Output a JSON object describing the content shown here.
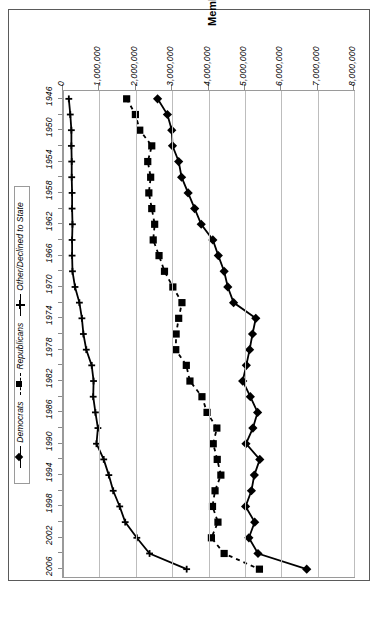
{
  "chart": {
    "title": "Membership",
    "value_axis_label": "Membership",
    "category_axis_label": ""
  },
  "legend": {
    "items": [
      {
        "label": "Democrats",
        "marker": "diamond",
        "line": "solid",
        "color": "#000000"
      },
      {
        "label": "Republicans",
        "marker": "square",
        "line": "dashed",
        "color": "#000000"
      },
      {
        "label": "Other/Declined to State",
        "marker": "cross",
        "line": "solid",
        "color": "#000000"
      }
    ]
  },
  "chart_data": {
    "type": "line",
    "orientation": "horizontal-bars-rotated",
    "title": "Membership",
    "xlabel": "Membership",
    "ylabel": "",
    "xlim": [
      0,
      8000000
    ],
    "grid": true,
    "legend_position": "left",
    "xtick_labels": [
      "0",
      "1,000,000",
      "2,000,000",
      "3,000,000",
      "4,000,000",
      "5,000,000",
      "6,000,000",
      "7,000,000",
      "8,000,000"
    ],
    "xticks": [
      0,
      1000000,
      2000000,
      3000000,
      4000000,
      5000000,
      6000000,
      7000000,
      8000000
    ],
    "categories": [
      1946,
      1948,
      1950,
      1952,
      1954,
      1956,
      1958,
      1960,
      1962,
      1964,
      1966,
      1968,
      1970,
      1972,
      1974,
      1976,
      1978,
      1980,
      1982,
      1984,
      1986,
      1988,
      1990,
      1992,
      1994,
      1996,
      1998,
      2000,
      2002,
      2004,
      2006
    ],
    "ytick_labels": [
      "1946",
      "1950",
      "1954",
      "1958",
      "1962",
      "1966",
      "1970",
      "1974",
      "1978",
      "1982",
      "1986",
      "1990",
      "1994",
      "1998",
      "2002",
      "2006"
    ],
    "series": [
      {
        "name": "Democrats",
        "marker": "diamond",
        "line": "solid",
        "values": [
          2600000,
          2870000,
          2990000,
          3010000,
          3180000,
          3260000,
          3440000,
          3620000,
          3800000,
          4120000,
          4270000,
          4430000,
          4530000,
          4690000,
          5300000,
          5210000,
          5130000,
          5040000,
          4940000,
          5150000,
          5350000,
          5220000,
          5030000,
          5410000,
          5260000,
          5180000,
          5020000,
          5270000,
          5110000,
          5360000,
          6700000
        ]
      },
      {
        "name": "Republicans",
        "marker": "square",
        "line": "dashed",
        "values": [
          1750000,
          1990000,
          2110000,
          2440000,
          2330000,
          2410000,
          2360000,
          2440000,
          2520000,
          2480000,
          2640000,
          2790000,
          3020000,
          3270000,
          3180000,
          3110000,
          3100000,
          3390000,
          3490000,
          3820000,
          3960000,
          4230000,
          4130000,
          4240000,
          4340000,
          4180000,
          4110000,
          4260000,
          4080000,
          4430000,
          5400000
        ]
      },
      {
        "name": "Other/Declined to State",
        "marker": "cross",
        "line": "solid",
        "values": [
          160000,
          200000,
          230000,
          230000,
          240000,
          240000,
          250000,
          250000,
          260000,
          250000,
          250000,
          260000,
          330000,
          450000,
          520000,
          560000,
          640000,
          790000,
          840000,
          830000,
          890000,
          960000,
          920000,
          1120000,
          1260000,
          1380000,
          1560000,
          1710000,
          2030000,
          2380000,
          3400000
        ]
      }
    ]
  }
}
